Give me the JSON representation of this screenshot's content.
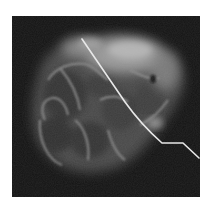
{
  "image": {
    "kind": "radiograph",
    "subject": "specimen with localization wire",
    "background_color": "#131313",
    "frame_color": "#ffffff",
    "tissue_colors": {
      "dark": "#3a3a3a",
      "mid": "#6e6e6e",
      "bright": "#c8c8c8"
    },
    "wire_color": "#e8e8e8",
    "wire_path_points": [
      [
        82,
        39
      ],
      [
        110,
        80
      ],
      [
        130,
        108
      ],
      [
        145,
        125
      ],
      [
        162,
        143
      ],
      [
        183,
        143
      ],
      [
        199,
        158
      ]
    ]
  }
}
